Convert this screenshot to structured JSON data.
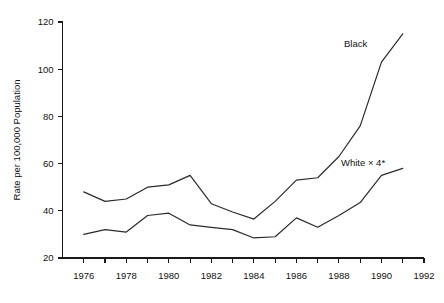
{
  "chart_data": {
    "type": "line",
    "title": "",
    "xlabel": "",
    "ylabel": "Rate per 100,000 Population",
    "xlim": [
      1975,
      1992
    ],
    "ylim": [
      20,
      120
    ],
    "grid": false,
    "legend_position": "inline-annotation",
    "x": [
      1976,
      1977,
      1978,
      1979,
      1980,
      1981,
      1982,
      1983,
      1984,
      1985,
      1986,
      1987,
      1988,
      1989,
      1990,
      1991
    ],
    "x_tick_labels": [
      "1976",
      "1978",
      "1980",
      "1982",
      "1984",
      "1986",
      "1988",
      "1990",
      "1992"
    ],
    "x_tick_values": [
      1976,
      1978,
      1980,
      1982,
      1984,
      1986,
      1988,
      1990,
      1992
    ],
    "x_minor_ticks": [
      1976,
      1977,
      1978,
      1979,
      1980,
      1981,
      1982,
      1983,
      1984,
      1985,
      1986,
      1987,
      1988,
      1989,
      1990,
      1991,
      1992
    ],
    "y_tick_labels": [
      "20",
      "40",
      "60",
      "80",
      "100",
      "120"
    ],
    "y_tick_values": [
      20,
      40,
      60,
      80,
      100,
      120
    ],
    "series": [
      {
        "name": "Black",
        "label": "Black",
        "color": "#2b2b2b",
        "values": [
          48,
          44,
          45,
          50,
          51,
          55,
          43,
          39.5,
          36.5,
          44,
          53,
          54,
          63,
          76,
          103,
          115
        ]
      },
      {
        "name": "White x 4",
        "label": "White × 4*",
        "color": "#2b2b2b",
        "values": [
          30,
          32,
          31,
          38,
          39,
          34,
          33,
          32,
          28.5,
          29,
          37,
          33,
          38,
          43.5,
          55,
          58
        ]
      }
    ]
  }
}
